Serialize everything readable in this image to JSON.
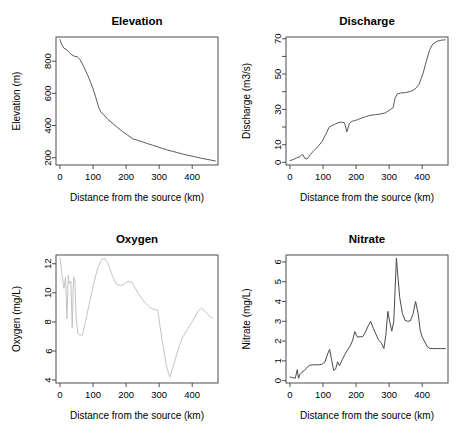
{
  "figure": {
    "name": "river-longitudinal-profiles",
    "background": "#ffffff",
    "layout": "2x2 panel grid",
    "line_color_default": "#595959",
    "line_color_light": "#c4c4c4",
    "axis_color": "#4d4d4d"
  },
  "chart_data": [
    {
      "id": "elevation",
      "type": "line",
      "title": "Elevation",
      "xlabel": "Distance from the source (km)",
      "ylabel": "Elevation (m)",
      "xlim": [
        -12,
        478
      ],
      "ylim": [
        155,
        950
      ],
      "xticks": [
        0,
        100,
        200,
        300,
        400
      ],
      "yticks": [
        200,
        400,
        600,
        800
      ],
      "grid": false,
      "legend": "none",
      "line_color": "#595959",
      "x": [
        0,
        5,
        12,
        20,
        28,
        36,
        44,
        52,
        60,
        68,
        76,
        84,
        92,
        100,
        108,
        116,
        124,
        132,
        145,
        160,
        175,
        190,
        205,
        220,
        235,
        250,
        265,
        280,
        295,
        310,
        325,
        340,
        355,
        370,
        385,
        400,
        415,
        430,
        445,
        460,
        470
      ],
      "y": [
        934,
        905,
        880,
        872,
        855,
        838,
        830,
        828,
        812,
        782,
        748,
        712,
        672,
        628,
        578,
        520,
        482,
        468,
        438,
        412,
        386,
        362,
        340,
        318,
        308,
        298,
        288,
        278,
        268,
        258,
        248,
        240,
        232,
        224,
        216,
        210,
        203,
        196,
        190,
        184,
        180
      ]
    },
    {
      "id": "discharge",
      "type": "line",
      "title": "Discharge",
      "xlabel": "Distance from the source (km)",
      "ylabel": "Discharge (m3/s)",
      "xlim": [
        -12,
        478
      ],
      "ylim": [
        -1.5,
        71
      ],
      "xticks": [
        0,
        100,
        200,
        300,
        400
      ],
      "yticks": [
        0,
        10,
        30,
        50,
        70
      ],
      "yticks_minor": [
        20,
        40,
        60
      ],
      "grid": false,
      "legend": "none",
      "line_color": "#595959",
      "x": [
        0,
        10,
        20,
        30,
        38,
        45,
        52,
        62,
        72,
        85,
        98,
        110,
        118,
        125,
        135,
        145,
        155,
        165,
        172,
        180,
        188,
        195,
        205,
        215,
        228,
        242,
        258,
        272,
        288,
        300,
        312,
        318,
        325,
        335,
        350,
        365,
        378,
        390,
        402,
        412,
        422,
        432,
        445,
        458,
        470
      ],
      "y": [
        1.0,
        1.6,
        2.5,
        3.2,
        4.6,
        2.2,
        2.0,
        4.5,
        6.6,
        9.0,
        12.0,
        16.5,
        19.8,
        20.6,
        21.5,
        22.4,
        22.8,
        22.4,
        17.3,
        22.2,
        23.3,
        23.6,
        24.2,
        25.0,
        25.8,
        26.6,
        27.0,
        27.3,
        28.0,
        29.4,
        31.0,
        36.5,
        38.8,
        39.3,
        39.5,
        40.2,
        41.5,
        44.0,
        50.0,
        57.0,
        63.5,
        67.0,
        68.6,
        69.2,
        69.4
      ]
    },
    {
      "id": "oxygen",
      "type": "line",
      "title": "Oxygen",
      "xlabel": "Distance from the source (km)",
      "ylabel": "Oxygen (mg/L)",
      "xlim": [
        -12,
        478
      ],
      "ylim": [
        3.8,
        12.6
      ],
      "xticks": [
        0,
        100,
        200,
        300,
        400
      ],
      "yticks": [
        4,
        6,
        8,
        10,
        12
      ],
      "grid": false,
      "legend": "none",
      "line_color": "#c4c4c4",
      "x": [
        0,
        6,
        12,
        17,
        21,
        25,
        29,
        33,
        37,
        41,
        45,
        49,
        54,
        60,
        68,
        78,
        90,
        102,
        114,
        126,
        136,
        146,
        158,
        170,
        182,
        194,
        206,
        218,
        228,
        238,
        248,
        258,
        268,
        278,
        288,
        296,
        302,
        310,
        322,
        332,
        342,
        356,
        370,
        386,
        402,
        416,
        428,
        440,
        452,
        462
      ],
      "y": [
        12.4,
        11.3,
        10.3,
        11.1,
        8.2,
        11.2,
        10.6,
        10.8,
        7.6,
        11.1,
        10.9,
        8.3,
        7.2,
        7.1,
        7.1,
        8.1,
        9.4,
        10.6,
        11.7,
        12.3,
        12.35,
        12.0,
        11.2,
        10.6,
        10.5,
        10.6,
        10.8,
        10.7,
        10.3,
        9.9,
        9.6,
        9.3,
        9.1,
        8.9,
        8.85,
        8.8,
        7.8,
        6.6,
        5.0,
        4.2,
        4.9,
        6.0,
        6.9,
        7.5,
        8.1,
        8.7,
        8.95,
        8.7,
        8.4,
        8.25
      ]
    },
    {
      "id": "nitrate",
      "type": "line",
      "title": "Nitrate",
      "xlabel": "Distance from the source (km)",
      "ylabel": "Nitrate (mg/L)",
      "xlim": [
        -12,
        478
      ],
      "ylim": [
        -0.12,
        6.35
      ],
      "xticks": [
        0,
        100,
        200,
        300,
        400
      ],
      "yticks": [
        0,
        1,
        2,
        3,
        4,
        5,
        6
      ],
      "grid": false,
      "legend": "none",
      "line_color": "#4a4a4a",
      "x": [
        0,
        8,
        16,
        22,
        26,
        30,
        36,
        44,
        52,
        60,
        68,
        76,
        86,
        96,
        106,
        114,
        120,
        126,
        132,
        138,
        144,
        150,
        158,
        166,
        174,
        182,
        190,
        196,
        204,
        212,
        220,
        228,
        236,
        244,
        252,
        260,
        268,
        276,
        284,
        290,
        296,
        302,
        308,
        314,
        318,
        322,
        326,
        332,
        340,
        348,
        356,
        364,
        372,
        380,
        388,
        394,
        400,
        408,
        416,
        424,
        432,
        444,
        458,
        470
      ],
      "y": [
        0.18,
        0.15,
        0.12,
        0.55,
        0.12,
        0.3,
        0.42,
        0.52,
        0.68,
        0.78,
        0.8,
        0.8,
        0.8,
        0.82,
        0.95,
        1.35,
        1.58,
        1.05,
        0.52,
        0.58,
        0.95,
        0.75,
        1.05,
        1.32,
        1.55,
        1.75,
        2.05,
        2.48,
        2.2,
        2.22,
        2.22,
        2.45,
        2.75,
        3.0,
        2.65,
        2.35,
        2.05,
        1.92,
        1.62,
        2.3,
        3.5,
        2.95,
        2.5,
        3.0,
        4.6,
        6.2,
        5.35,
        4.2,
        3.4,
        3.05,
        3.0,
        3.02,
        3.35,
        4.0,
        3.35,
        2.55,
        2.2,
        1.95,
        1.7,
        1.62,
        1.62,
        1.62,
        1.62,
        1.62
      ]
    }
  ]
}
